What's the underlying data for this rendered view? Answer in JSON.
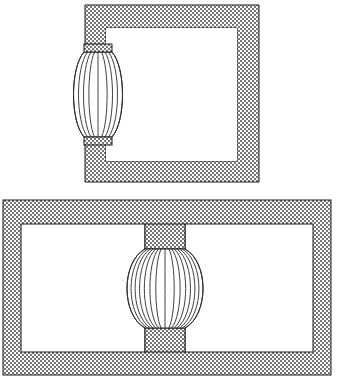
{
  "document": {
    "title": "Patent Line Drawing — Two Chamber Figures",
    "kind": "technical-illustration",
    "canvas": {
      "width": 338,
      "height": 383,
      "background": "#ffffff"
    }
  },
  "style": {
    "line_color": "#1a1a1a",
    "rib_color": "#2b2b2b",
    "void_color": "#ffffff",
    "hatch_color_dark": "#6e6e6e",
    "hatch_color_light": "#d9d9d9",
    "hatch_pattern": "checkerboard-stipple",
    "hatch_cell_px": 2
  },
  "figures": [
    {
      "id": "figure-top",
      "name": "Open C-frame chamber with side lens element",
      "outer": {
        "x": 85,
        "y": 5,
        "width": 174,
        "height": 177
      },
      "void": {
        "x": 106,
        "y": 28,
        "width": 131,
        "height": 133
      },
      "wall_thickness_px": 21,
      "aperture": {
        "side": "left",
        "y_top": 52,
        "y_bottom": 137,
        "opening_height": 85
      },
      "lens": {
        "shape": "barrel",
        "center_x": 98,
        "center_y": 94,
        "half_width": 24,
        "top_y": 52,
        "bottom_y": 137,
        "rib_count": 9,
        "neck_width": 28
      }
    },
    {
      "id": "figure-bottom",
      "name": "Twin chamber housing with central spherical element",
      "outer": {
        "x": 3,
        "y": 200,
        "width": 328,
        "height": 175
      },
      "wall_thickness_px": 18,
      "voids": [
        {
          "id": "chamber-left",
          "x": 21,
          "y": 224,
          "width": 124,
          "height": 128
        },
        {
          "id": "chamber-right",
          "x": 185,
          "y": 224,
          "width": 128,
          "height": 128
        }
      ],
      "bridge": {
        "id": "center-neck",
        "x": 145,
        "width": 40,
        "top_y": 200,
        "top_neck_bottom_y": 249,
        "bottom_neck_top_y": 328,
        "bottom_y": 375
      },
      "sphere": {
        "shape": "barrel-sphere",
        "center_x": 165,
        "center_y": 288,
        "half_width": 40,
        "top_y": 249,
        "bottom_y": 328,
        "rib_count": 15,
        "neck_width": 40
      }
    }
  ],
  "labels": {
    "figure_top_caption": "",
    "figure_bottom_caption": ""
  }
}
